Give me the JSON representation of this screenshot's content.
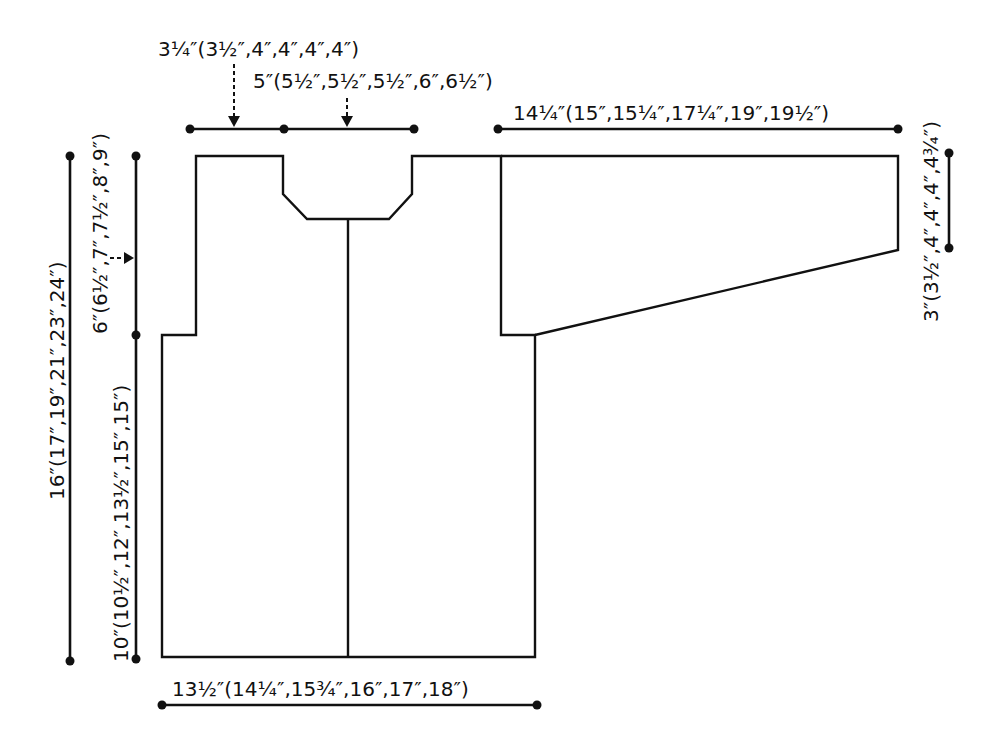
{
  "diagram": {
    "type": "knitting-schematic",
    "pieces": [
      "body-front",
      "sleeve"
    ],
    "colors": {
      "line": "#111111",
      "background": "#ffffff"
    }
  },
  "labels": {
    "shoulder_width": "3¼″(3½″,4″,4″,4″,4″)",
    "neck_width": "5″(5½″,5½″,5½″,6″,6½″)",
    "sleeve_length": "14¼″(15″,15¼″,17¼″,19″,19½″)",
    "sleeve_cuff_depth": "3″(3½″,4″,4″,4″,4¾″)",
    "total_length": "16″(17″,19″,21″,23″,24″)",
    "armhole_depth": "6″(6½″,7″,7½″,8″,9″)",
    "body_length_to_armhole": "10″(10½″,12″,13½″,15″,15″)",
    "body_width": "13½″(14¼″,15¾″,16″,17″,18″)"
  }
}
